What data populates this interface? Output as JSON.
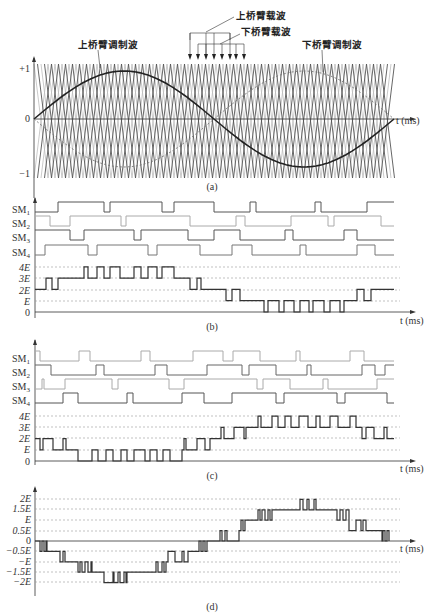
{
  "figure": {
    "panels": [
      {
        "id": "a",
        "caption": "(a)",
        "annotations": {
          "upper_modulation": "上桥臂调制波",
          "upper_carrier": "上桥臂载波",
          "lower_carrier": "下桥臂载波",
          "lower_modulation": "下桥臂调制波"
        },
        "y_ticks": [
          "+1",
          "0",
          "−1"
        ],
        "x_label": "t (ms)"
      },
      {
        "id": "b",
        "caption": "(b)",
        "signals": [
          "SM1",
          "SM2",
          "SM3",
          "SM4"
        ],
        "y_ticks": [
          "4E",
          "3E",
          "2E",
          "E",
          "0"
        ],
        "x_label": "t (ms)"
      },
      {
        "id": "c",
        "caption": "(c)",
        "signals": [
          "SM1",
          "SM2",
          "SM3",
          "SM4"
        ],
        "y_ticks": [
          "4E",
          "3E",
          "2E",
          "E",
          "0"
        ],
        "x_label": "t (ms)"
      },
      {
        "id": "d",
        "caption": "(d)",
        "y_ticks": [
          "2E",
          "1.5E",
          "E",
          "0.5E",
          "0",
          "−0.5E",
          "−E",
          "−1.5E",
          "−2E"
        ],
        "x_label": "t (ms)"
      }
    ]
  },
  "chart_data": [
    {
      "type": "line",
      "title": "(a) Carrier-based modulation: upper/lower arm modulation waves and phase-shifted triangular carriers",
      "xlabel": "t (ms)",
      "ylabel": "",
      "ylim": [
        -1,
        1
      ],
      "series": [
        {
          "name": "上桥臂调制波",
          "shape": "sine, amplitude ~0.8, starts at 0 rising, one full period"
        },
        {
          "name": "下桥臂调制波",
          "shape": "inverted sine (dashed), amplitude ~0.8"
        },
        {
          "name": "上桥臂载波",
          "shape": "4 phase-shifted triangular carriers (dark)"
        },
        {
          "name": "下桥臂载波",
          "shape": "4 phase-shifted triangular carriers (light)"
        }
      ]
    },
    {
      "type": "line",
      "title": "(b) Upper-arm submodule states and arm output level",
      "xlabel": "t (ms)",
      "categories": [
        "4E",
        "3E",
        "2E",
        "E",
        "0"
      ],
      "series": [
        {
          "name": "output_level",
          "values_E": [
            2,
            3,
            2,
            3,
            3,
            4,
            3,
            4,
            3,
            4,
            3,
            4,
            3,
            4,
            3,
            3,
            2,
            3,
            2,
            2,
            1,
            2,
            1,
            1,
            0,
            1,
            0,
            1,
            0,
            1,
            0,
            1,
            0,
            1,
            0,
            1,
            1,
            2,
            1,
            2,
            1
          ]
        }
      ]
    },
    {
      "type": "line",
      "title": "(c) Lower-arm submodule states and arm output level",
      "xlabel": "t (ms)",
      "categories": [
        "4E",
        "3E",
        "2E",
        "E",
        "0"
      ],
      "series": [
        {
          "name": "output_level",
          "values_E": [
            2,
            1,
            2,
            1,
            2,
            1,
            0,
            1,
            0,
            1,
            0,
            1,
            0,
            1,
            0,
            1,
            0,
            1,
            1,
            2,
            1,
            2,
            1,
            2,
            3,
            2,
            3,
            2,
            3,
            4,
            3,
            4,
            3,
            4,
            3,
            4,
            3,
            4,
            3,
            4,
            3,
            2,
            3,
            2,
            3,
            2
          ]
        }
      ]
    },
    {
      "type": "line",
      "title": "(d) Output phase voltage",
      "xlabel": "t (ms)",
      "ylim": [
        -2,
        2
      ],
      "categories": [
        "2E",
        "1.5E",
        "E",
        "0.5E",
        "0",
        "-0.5E",
        "-E",
        "-1.5E",
        "-2E"
      ],
      "series": [
        {
          "name": "phase_voltage",
          "values_E": [
            0,
            -0.5,
            -1,
            -1.5,
            -2,
            -1.5,
            -1,
            -0.5,
            0,
            0.5,
            1,
            1.5,
            2,
            1.5,
            1,
            0.5,
            0
          ]
        }
      ]
    }
  ]
}
